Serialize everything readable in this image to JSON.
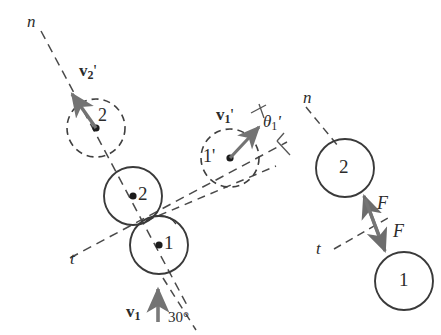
{
  "figure": {
    "type": "physics-collision-diagram",
    "background_color": "#ffffff",
    "stroke_color": "#3a3a3a",
    "arrow_color": "#6e6e6e",
    "dash_color": "#4a4a4a",
    "width": 441,
    "height": 335
  },
  "left_panel": {
    "axis_labels": {
      "normal": "n",
      "tangent": "t"
    },
    "balls": [
      {
        "id": "ball-2-contact",
        "label": "2",
        "style": "solid"
      },
      {
        "id": "ball-1-contact",
        "label": "1",
        "style": "solid"
      },
      {
        "id": "ball-2-after",
        "label": "2",
        "style": "dashed"
      },
      {
        "id": "ball-1-after",
        "label": "1'",
        "style": "dashed"
      }
    ],
    "vectors": [
      {
        "id": "v2-prime",
        "base": "v",
        "sub": "2",
        "prime": "'",
        "text": "v2'"
      },
      {
        "id": "v1-prime",
        "base": "v",
        "sub": "1",
        "prime": "'",
        "text": "v1'"
      },
      {
        "id": "v1-initial",
        "base": "v",
        "sub": "1",
        "prime": "",
        "text": "v1"
      }
    ],
    "angles": [
      {
        "id": "theta-1-prime",
        "symbol": "θ",
        "sub": "1",
        "prime": "'",
        "text": "θ1'"
      },
      {
        "id": "incidence-angle",
        "value": "30°"
      }
    ]
  },
  "right_panel": {
    "axis_labels": {
      "normal": "n",
      "tangent": "t"
    },
    "balls": [
      {
        "id": "fbd-ball-2",
        "label": "2",
        "style": "solid"
      },
      {
        "id": "fbd-ball-1",
        "label": "1",
        "style": "solid"
      }
    ],
    "forces": [
      {
        "id": "force-on-2",
        "label": "F"
      },
      {
        "id": "force-on-1",
        "label": "F"
      }
    ]
  }
}
